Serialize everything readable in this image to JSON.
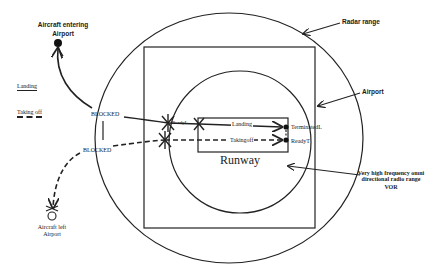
{
  "diagram": {
    "colors": {
      "stroke": "#222222",
      "background": "#ffffff"
    },
    "regions": {
      "radar_range": {
        "label": "Radar range",
        "shape": "circle"
      },
      "airport": {
        "label": "Airport",
        "shape": "square"
      },
      "vor": {
        "label_line1": "Very high frequency omni",
        "label_line2": "directional radio range",
        "label_line3": "VOR",
        "shape": "circle"
      },
      "runway": {
        "label": "Runway",
        "shape": "rectangle"
      }
    },
    "legend": {
      "landing": "Landing",
      "taking_off": "Taking off"
    },
    "nodes": {
      "aircraft_entering": {
        "line1": "Aircraft entering",
        "line2": "Airport"
      },
      "aircraft_left": {
        "line1": "Aircraft left",
        "line2": "Airport"
      },
      "blocked_top": "BLOCKED",
      "blocked_bottom": "BLOCKED",
      "ready_l": "ReadyL",
      "terminated_l": "TerminatedL",
      "ready_t": "ReadyT"
    },
    "transitions": {
      "landing": "Landing",
      "takingoff": "Takingoff"
    }
  }
}
